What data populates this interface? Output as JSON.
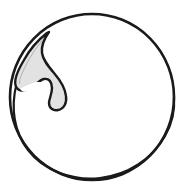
{
  "figure": {
    "title": "Spherical cell outline with internal hooked appendage",
    "domain_label": "line-drawing",
    "background_color": "#ffffff",
    "stroke_color": "#1a1a1a",
    "fill_color_body": "#ffffff",
    "fill_color_appendage": "#e2e2e2",
    "canvas": {
      "width": 182,
      "height": 196
    },
    "elements": {
      "outer_circle": {
        "name": "outer circle outline",
        "center_x": 92,
        "center_y": 97,
        "radius_x": 82,
        "radius_y": 83,
        "stroke_width": 2.6
      },
      "inner_arc": {
        "name": "inner crescent arc",
        "center_x": 93,
        "center_y": 92,
        "radius_x": 79,
        "radius_y": 80,
        "stroke_width": 2.2,
        "start_angle_deg": 105,
        "end_angle_deg": 358
      },
      "appendage": {
        "name": "hooked droplet appendage",
        "description": "tapered flame-like lobe along upper-left inner wall terminating in a curled hook",
        "stroke_width": 2.4,
        "fill": "#e2e2e2"
      }
    }
  }
}
